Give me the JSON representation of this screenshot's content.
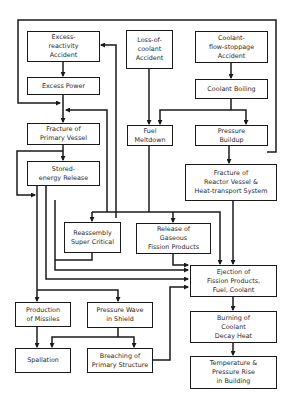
{
  "diagram": {
    "type": "flowchart",
    "title": "",
    "nodes": {
      "excess_reactivity": "Excess-\nreactivity\nAccident",
      "excess_power": "Excess Power",
      "fracture_primary": "Fracture of\nPrimary Vessel",
      "stored_energy": "Stored-\nenergy Release",
      "loss_of_coolant": "Loss-of-\ncoolant\nAccident",
      "coolant_flow_stoppage": "Coolant-\nflow-stoppage\nAccident",
      "coolant_boiling": "Coolant Boiling",
      "fuel_meltdown": "Fuel\nMeltdown",
      "pressure_buildup": "Pressure\nBuildup",
      "fracture_reactor": "Fracture of\nReactor Vessel &\nHeat-transport System",
      "reassembly": "Reassembly\nSuper Critical",
      "release_gaseous": "Release of\nGaseous\nFission Products",
      "ejection": "Ejection of\nFission Products,\nFuel, Coolant",
      "production_missiles": "Production\nof Missiles",
      "pressure_wave": "Pressure Wave\nin Shield",
      "spallation": "Spallation",
      "breaching": "Breaching of\nPrimary Structure",
      "burning_coolant": "Burning of\nCoolant\nDecay Heat",
      "temperature_pressure": "Temperature &\nPressure Rise\nin Building"
    },
    "edges": [
      [
        "excess_reactivity",
        "excess_power"
      ],
      [
        "excess_power",
        "fracture_primary"
      ],
      [
        "coolant_flow_stoppage",
        "fracture_primary"
      ],
      [
        "fuel_meltdown",
        "fracture_primary"
      ],
      [
        "fracture_primary",
        "stored_energy"
      ],
      [
        "fracture_primary",
        "production_missiles"
      ],
      [
        "loss_of_coolant",
        "fuel_meltdown"
      ],
      [
        "coolant_flow_stoppage",
        "coolant_boiling"
      ],
      [
        "coolant_boiling",
        "fuel_meltdown"
      ],
      [
        "coolant_boiling",
        "pressure_buildup"
      ],
      [
        "pressure_buildup",
        "fracture_reactor"
      ],
      [
        "coolant_flow_stoppage",
        "pressure_buildup"
      ],
      [
        "fuel_meltdown",
        "reassembly"
      ],
      [
        "fuel_meltdown",
        "release_gaseous"
      ],
      [
        "fuel_meltdown",
        "ejection"
      ],
      [
        "fracture_reactor",
        "ejection"
      ],
      [
        "release_gaseous",
        "ejection"
      ],
      [
        "reassembly",
        "ejection"
      ],
      [
        "stored_energy",
        "production_missiles"
      ],
      [
        "stored_energy",
        "pressure_wave"
      ],
      [
        "stored_energy",
        "ejection"
      ],
      [
        "excess_reactivity",
        "excess_power"
      ],
      [
        "production_missiles",
        "spallation"
      ],
      [
        "pressure_wave",
        "spallation"
      ],
      [
        "pressure_wave",
        "breaching"
      ],
      [
        "breaching",
        "ejection"
      ],
      [
        "ejection",
        "burning_coolant"
      ],
      [
        "burning_coolant",
        "temperature_pressure"
      ]
    ]
  }
}
